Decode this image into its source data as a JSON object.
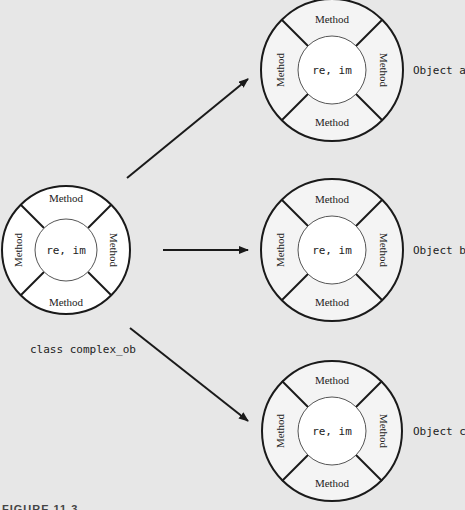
{
  "diagram": {
    "class": {
      "label": "class complex_ob",
      "center": "re, im",
      "methods": {
        "top": "Method",
        "bottom": "Method",
        "left": "Method",
        "right": "Method"
      }
    },
    "objects": [
      {
        "label": "Object a",
        "center": "re, im",
        "methods": {
          "top": "Method",
          "bottom": "Method",
          "left": "Method",
          "right": "Method"
        }
      },
      {
        "label": "Object b",
        "center": "re, im",
        "methods": {
          "top": "Method",
          "bottom": "Method",
          "left": "Method",
          "right": "Method"
        }
      },
      {
        "label": "Object c",
        "center": "re, im",
        "methods": {
          "top": "Method",
          "bottom": "Method",
          "left": "Method",
          "right": "Method"
        }
      }
    ],
    "caption_partial": "FIGURE 11.3"
  },
  "colors": {
    "background": "#e7e7e7",
    "stroke": "#1a1a1a",
    "ring_fill": "#f4f4f4",
    "center_fill": "#ffffff"
  }
}
